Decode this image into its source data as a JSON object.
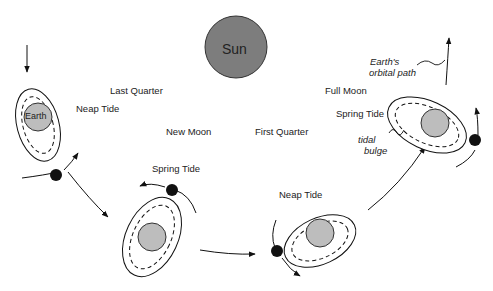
{
  "sun": {
    "label": "Sun",
    "color": "#7d7d7d"
  },
  "earth": {
    "label": "Earth",
    "color": "#bdbdbd"
  },
  "moon_color": "#111111",
  "phases": [
    {
      "name": "Last Quarter",
      "tide": "Neap Tide"
    },
    {
      "name": "New Moon",
      "tide": "Spring Tide"
    },
    {
      "name": "First Quarter",
      "tide": "Neap Tide"
    },
    {
      "name": "Full Moon",
      "tide": "Spring Tide"
    }
  ],
  "annotations": {
    "orbital_path_line1": "Earth's",
    "orbital_path_line2": "orbital path",
    "tidal_bulge_line1": "tidal",
    "tidal_bulge_line2": "bulge"
  }
}
